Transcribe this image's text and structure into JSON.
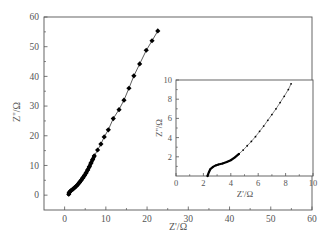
{
  "chart_data": [
    {
      "id": "main",
      "type": "scatter",
      "title": "",
      "xlabel": "Z'/Ω",
      "ylabel": "Z''/Ω",
      "xlim": [
        -5,
        60
      ],
      "ylim": [
        -5,
        60
      ],
      "xticks": [
        0,
        10,
        20,
        30,
        40,
        50,
        60
      ],
      "yticks": [
        0,
        10,
        20,
        30,
        40,
        50,
        60
      ],
      "grid": false,
      "legend": null,
      "marker": "diamond",
      "line": true,
      "series": [
        {
          "name": "impedance",
          "x": [
            1.0,
            1.1,
            1.3,
            1.6,
            2.0,
            2.4,
            2.8,
            3.2,
            3.6,
            4.0,
            4.4,
            4.8,
            5.2,
            5.6,
            6.0,
            6.4,
            6.8,
            7.2,
            8.0,
            8.8,
            9.6,
            10.6,
            11.8,
            13.2,
            14.4,
            15.6,
            16.8,
            18.2,
            19.8,
            21.2,
            22.6
          ],
          "y": [
            0.3,
            0.8,
            1.2,
            1.6,
            2.0,
            2.5,
            3.0,
            3.6,
            4.3,
            5.0,
            5.8,
            6.6,
            7.5,
            8.5,
            9.6,
            10.8,
            12.0,
            13.2,
            15.2,
            17.2,
            19.6,
            22.0,
            25.8,
            28.8,
            32.0,
            36.0,
            40.2,
            44.2,
            48.8,
            52.0,
            55.3
          ]
        }
      ]
    },
    {
      "id": "inset",
      "type": "scatter",
      "title": "",
      "xlabel": "Z'/Ω",
      "ylabel": "Z''/Ω",
      "xlim": [
        0,
        10
      ],
      "ylim": [
        0,
        10
      ],
      "xticks": [
        0,
        2,
        4,
        6,
        8,
        10
      ],
      "yticks": [
        2,
        4,
        6,
        8,
        10
      ],
      "grid": false,
      "legend": null,
      "marker": "dot",
      "line": true,
      "series": [
        {
          "name": "impedance-zoom",
          "x": [
            2.3,
            2.4,
            2.5,
            2.7,
            2.9,
            3.1,
            3.4,
            3.7,
            4.0,
            4.3,
            4.6,
            4.9,
            5.2,
            5.5,
            5.8,
            6.1,
            6.4,
            6.7,
            7.0,
            7.3,
            7.6,
            7.9,
            8.2,
            8.4
          ],
          "y": [
            0.0,
            0.4,
            0.7,
            0.95,
            1.1,
            1.2,
            1.3,
            1.45,
            1.65,
            1.95,
            2.3,
            2.7,
            3.15,
            3.6,
            4.1,
            4.65,
            5.2,
            5.8,
            6.4,
            7.0,
            7.65,
            8.3,
            9.0,
            9.6
          ]
        }
      ]
    }
  ],
  "labels": {
    "main_xlabel": "Z'/Ω",
    "main_ylabel": "Z''/Ω",
    "inset_xlabel": "Z'/Ω",
    "inset_ylabel": "Z''/Ω"
  }
}
